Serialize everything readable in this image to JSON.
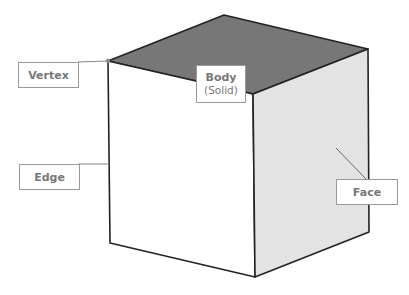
{
  "labels": {
    "vertex": "Vertex",
    "edge": "Edge",
    "body": "Body",
    "body_sub": "(Solid)",
    "face": "Face"
  },
  "colors": {
    "top_face": "#777777",
    "left_face": "#ffffff",
    "right_face": "#e3e3e3",
    "edge": "#222222",
    "leader": "#888888",
    "label_text": "#777777"
  }
}
